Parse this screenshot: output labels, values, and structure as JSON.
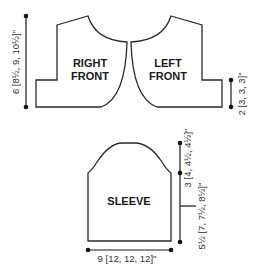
{
  "diagram": {
    "type": "knitting-schematic",
    "pieces": [
      {
        "id": "right-front",
        "label_lines": [
          "RIGHT",
          "FRONT"
        ]
      },
      {
        "id": "left-front",
        "label_lines": [
          "LEFT",
          "FRONT"
        ]
      },
      {
        "id": "sleeve",
        "label_lines": [
          "SLEEVE"
        ]
      }
    ],
    "dimensions": {
      "front_length": "6 [8½, 9, 10½]\"",
      "front_lower": "2 [3, 3, 3]\"",
      "sleeve_cap": "3 [4, 4½, 4½]\"",
      "sleeve_length": "5½ [7, 7½, 8½]\"",
      "sleeve_width": "9 [12, 12, 12]\""
    },
    "colors": {
      "line": "#2a2a2a",
      "text": "#333333",
      "background": "#ffffff"
    }
  }
}
